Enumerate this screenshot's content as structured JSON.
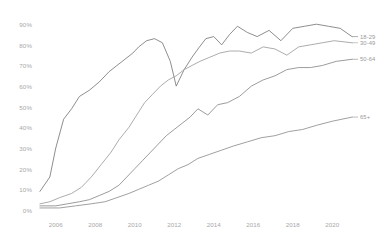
{
  "chart_data": {
    "type": "line",
    "title": "",
    "subtitle": "",
    "xlabel": "",
    "ylabel": "",
    "xlim": [
      2005,
      2021
    ],
    "ylim": [
      0,
      0.93
    ],
    "grid": false,
    "legend_position": "right-inline",
    "x_ticks": [
      "2006",
      "2008",
      "2010",
      "2012",
      "2014",
      "2016",
      "2018",
      "2020"
    ],
    "x_tick_values": [
      2006,
      2008,
      2010,
      2012,
      2014,
      2016,
      2018,
      2020
    ],
    "y_ticks": [
      "0%",
      "10%",
      "20%",
      "30%",
      "40%",
      "50%",
      "60%",
      "70%",
      "80%",
      "90%"
    ],
    "y_tick_values": [
      0,
      10,
      20,
      30,
      40,
      50,
      60,
      70,
      80,
      90
    ],
    "series": [
      {
        "name": "18-29",
        "color": "#7a7a7a",
        "label_value": 84,
        "x": [
          2005.2,
          2005.7,
          2006.0,
          2006.4,
          2006.8,
          2007.2,
          2007.7,
          2008.2,
          2008.7,
          2009.1,
          2009.5,
          2009.9,
          2010.2,
          2010.6,
          2011.0,
          2011.4,
          2011.8,
          2012.1,
          2012.5,
          2012.9,
          2013.2,
          2013.6,
          2014.0,
          2014.4,
          2014.8,
          2015.2,
          2015.7,
          2016.2,
          2016.8,
          2017.4,
          2018.0,
          2018.6,
          2019.2,
          2019.8,
          2020.4,
          2021.0
        ],
        "y": [
          9,
          16,
          30,
          44,
          49,
          55,
          58,
          62,
          67,
          70,
          73,
          76,
          79,
          82,
          83,
          81,
          72,
          60,
          68,
          74,
          78,
          83,
          84,
          80,
          85,
          89,
          86,
          84,
          87,
          82,
          88,
          89,
          90,
          89,
          88,
          84
        ]
      },
      {
        "name": "30-49",
        "color": "#9d9d9d",
        "label_value": 81,
        "x": [
          2005.2,
          2005.7,
          2006.2,
          2006.8,
          2007.3,
          2007.8,
          2008.3,
          2008.8,
          2009.2,
          2009.7,
          2010.1,
          2010.5,
          2010.9,
          2011.3,
          2011.7,
          2012.1,
          2012.5,
          2012.9,
          2013.3,
          2013.8,
          2014.3,
          2014.8,
          2015.3,
          2015.9,
          2016.5,
          2017.1,
          2017.7,
          2018.3,
          2018.9,
          2019.5,
          2020.1,
          2021.0
        ],
        "y": [
          3,
          4,
          6,
          8,
          11,
          16,
          22,
          28,
          34,
          40,
          46,
          52,
          56,
          60,
          63,
          65,
          68,
          70,
          72,
          74,
          76,
          77,
          77,
          76,
          79,
          78,
          75,
          79,
          80,
          81,
          82,
          81
        ]
      },
      {
        "name": "50-64",
        "color": "#8a8a8a",
        "label_value": 73,
        "x": [
          2005.2,
          2006.0,
          2006.6,
          2007.2,
          2007.7,
          2008.2,
          2008.7,
          2009.2,
          2009.6,
          2010.0,
          2010.4,
          2010.8,
          2011.2,
          2011.6,
          2012.0,
          2012.4,
          2012.8,
          2013.2,
          2013.7,
          2014.2,
          2014.7,
          2015.3,
          2015.9,
          2016.5,
          2017.1,
          2017.7,
          2018.3,
          2018.9,
          2019.5,
          2020.2,
          2021.0
        ],
        "y": [
          2,
          2,
          3,
          4,
          5,
          7,
          9,
          12,
          16,
          20,
          24,
          28,
          32,
          36,
          39,
          42,
          45,
          49,
          46,
          51,
          52,
          55,
          60,
          63,
          65,
          68,
          69,
          69,
          70,
          72,
          73
        ]
      },
      {
        "name": "65+",
        "color": "#8f8f8f",
        "label_value": 45,
        "x": [
          2005.2,
          2006.2,
          2007.0,
          2007.8,
          2008.5,
          2009.1,
          2009.7,
          2010.2,
          2010.7,
          2011.2,
          2011.7,
          2012.2,
          2012.7,
          2013.2,
          2013.8,
          2014.4,
          2015.0,
          2015.7,
          2016.4,
          2017.1,
          2017.8,
          2018.5,
          2019.2,
          2020.0,
          2021.0
        ],
        "y": [
          1,
          1,
          2,
          3,
          4,
          6,
          8,
          10,
          12,
          14,
          17,
          20,
          22,
          25,
          27,
          29,
          31,
          33,
          35,
          36,
          38,
          39,
          41,
          43,
          45
        ]
      }
    ]
  },
  "axis": {
    "tick_color": "#a8a8a8",
    "legend_color": "#9a9a9a"
  }
}
